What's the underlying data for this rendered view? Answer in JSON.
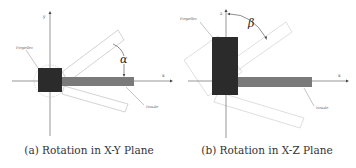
{
  "figure": {
    "panels": [
      {
        "id": "a",
        "caption": "(a) Rotation in X-Y Plane",
        "axes": {
          "horizontal": "x",
          "vertical": "y"
        },
        "labels": {
          "propeller": "Propeller",
          "nozzle": "Nozzle",
          "angle": "α"
        }
      },
      {
        "id": "b",
        "caption": "(b) Rotation in X-Z Plane",
        "axes": {
          "horizontal": "x",
          "vertical": "z"
        },
        "labels": {
          "propeller": "Propeller",
          "nozzle": "Nozzle",
          "angle": "β"
        }
      }
    ],
    "colors": {
      "propeller_block": "#2b2b2b",
      "nozzle_bar": "#7a7a7a",
      "axis": "#6a6a6a",
      "outline": "#c8c8c8"
    }
  }
}
